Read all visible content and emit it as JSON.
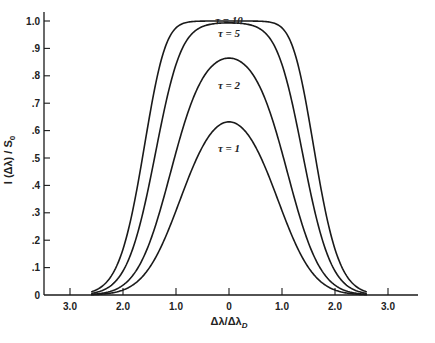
{
  "chart_data": {
    "type": "line",
    "title": "",
    "xlabel": "Δλ/Δλ_D",
    "ylabel": "I(Δλ)/S₀",
    "xlim": [
      -3.5,
      3.6
    ],
    "ylim": [
      0,
      1.0
    ],
    "grid": false,
    "legend": "inline curve labels",
    "x_ticks": [
      -3.0,
      -2.0,
      -1.0,
      0,
      1.0,
      2.0,
      3.0
    ],
    "x_tick_labels": [
      "3.0",
      "2.0",
      "1.0",
      "0",
      "1.0",
      "2.0",
      "3.0"
    ],
    "y_ticks": [
      0,
      0.1,
      0.2,
      0.3,
      0.4,
      0.5,
      0.6,
      0.7,
      0.8,
      0.9,
      1.0
    ],
    "y_tick_labels": [
      "0",
      ".1",
      ".2",
      ".3",
      ".4",
      ".5",
      ".6",
      ".7",
      ".8",
      ".9",
      "1.0"
    ],
    "x": [
      -2.6,
      -2.4,
      -2.2,
      -2.0,
      -1.8,
      -1.6,
      -1.4,
      -1.2,
      -1.0,
      -0.8,
      -0.6,
      -0.4,
      -0.2,
      0,
      0.2,
      0.4,
      0.6,
      0.8,
      1.0,
      1.2,
      1.4,
      1.6,
      1.8,
      2.0,
      2.2,
      2.4,
      2.6
    ],
    "series": [
      {
        "name": "τ = 1",
        "tau": 1,
        "peak": 0.63,
        "values": [
          0.001,
          0.003,
          0.008,
          0.018,
          0.038,
          0.074,
          0.131,
          0.211,
          0.308,
          0.41,
          0.501,
          0.573,
          0.617,
          0.632,
          0.617,
          0.573,
          0.501,
          0.41,
          0.308,
          0.211,
          0.131,
          0.074,
          0.038,
          0.018,
          0.008,
          0.003,
          0.001
        ]
      },
      {
        "name": "τ = 2",
        "tau": 2,
        "peak": 0.87,
        "values": [
          0.002,
          0.006,
          0.016,
          0.036,
          0.075,
          0.143,
          0.245,
          0.377,
          0.521,
          0.652,
          0.752,
          0.818,
          0.853,
          0.865,
          0.853,
          0.818,
          0.752,
          0.652,
          0.521,
          0.377,
          0.245,
          0.143,
          0.075,
          0.036,
          0.016,
          0.006,
          0.002
        ]
      },
      {
        "name": "τ = 5",
        "tau": 5,
        "peak": 0.99,
        "values": [
          0.006,
          0.016,
          0.039,
          0.088,
          0.177,
          0.319,
          0.505,
          0.697,
          0.841,
          0.929,
          0.97,
          0.986,
          0.992,
          0.993,
          0.992,
          0.986,
          0.97,
          0.929,
          0.841,
          0.697,
          0.505,
          0.319,
          0.177,
          0.088,
          0.039,
          0.016,
          0.006
        ]
      },
      {
        "name": "τ = 10",
        "tau": 10,
        "peak": 1.0,
        "values": [
          0.012,
          0.031,
          0.076,
          0.167,
          0.322,
          0.536,
          0.755,
          0.908,
          0.975,
          0.995,
          0.999,
          1.0,
          1.0,
          1.0,
          1.0,
          1.0,
          0.999,
          0.995,
          0.975,
          0.908,
          0.755,
          0.536,
          0.322,
          0.167,
          0.076,
          0.031,
          0.012
        ]
      }
    ],
    "model": "I/S0 = 1 - exp(-tau * exp(-x^2))",
    "curve_labels": [
      {
        "text": "τ = 10",
        "x": 0,
        "y": 1.005
      },
      {
        "text": "τ = 5",
        "x": 0,
        "y": 0.955
      },
      {
        "text": "τ = 2",
        "x": 0,
        "y": 0.765
      },
      {
        "text": "τ = 1",
        "x": 0,
        "y": 0.535
      }
    ]
  },
  "axes": {
    "x_title_main": "Δλ/Δλ",
    "x_title_sub": "D",
    "y_title": "I (Δλ) / S",
    "y_title_sub": "0"
  },
  "colors": {
    "line": "#1a1a1a",
    "text": "#222222",
    "background": "#ffffff"
  }
}
